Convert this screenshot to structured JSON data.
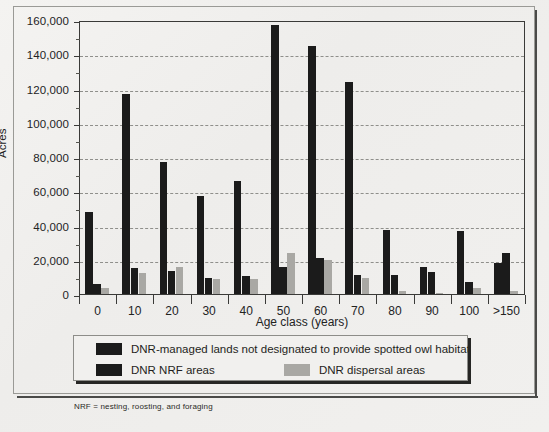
{
  "chart_data": {
    "type": "bar",
    "title": "",
    "xlabel": "Age class (years)",
    "ylabel": "Acres",
    "categories": [
      "0",
      "10",
      "20",
      "30",
      "40",
      "50",
      "60",
      "70",
      "80",
      "90",
      "100",
      ">150"
    ],
    "ylim": [
      0,
      160000
    ],
    "ytick_labels": [
      "0",
      "20,000",
      "40,000",
      "60,000",
      "80,000",
      "100,000",
      "120,000",
      "140,000",
      "160,000"
    ],
    "ytick_values": [
      0,
      20000,
      40000,
      60000,
      80000,
      100000,
      120000,
      140000,
      160000
    ],
    "ytick_minor_values": [
      10000,
      30000,
      50000,
      70000,
      90000,
      110000,
      130000,
      150000
    ],
    "grid": "horizontal-dashed",
    "legend_position": "below-plot",
    "series": [
      {
        "name": "DNR-managed lands not designated to provide spotted owl habitat",
        "color": "#1b1b1b",
        "values": [
          48000,
          117000,
          77000,
          57500,
          66000,
          157000,
          145000,
          124000,
          37500,
          15500,
          37000,
          18000
        ]
      },
      {
        "name": "DNR NRF areas",
        "color": "#1b1b1b",
        "values": [
          6000,
          15000,
          13500,
          9500,
          10500,
          16000,
          21000,
          11000,
          11000,
          13000,
          7000,
          24000
        ]
      },
      {
        "name": "DNR dispersal areas",
        "color": "#a9a8a4",
        "values": [
          3500,
          12000,
          16000,
          9000,
          8500,
          24000,
          20000,
          9500,
          2000,
          500,
          3500,
          2000
        ]
      }
    ]
  },
  "legend": {
    "items": [
      {
        "label": "DNR-managed lands not designated to provide spotted owl habitat",
        "swatch": "sw0"
      },
      {
        "label": "DNR NRF areas",
        "swatch": "sw1"
      },
      {
        "label": "DNR dispersal areas",
        "swatch": "sw2"
      }
    ]
  },
  "footnote": "NRF = nesting, roosting, and foraging"
}
